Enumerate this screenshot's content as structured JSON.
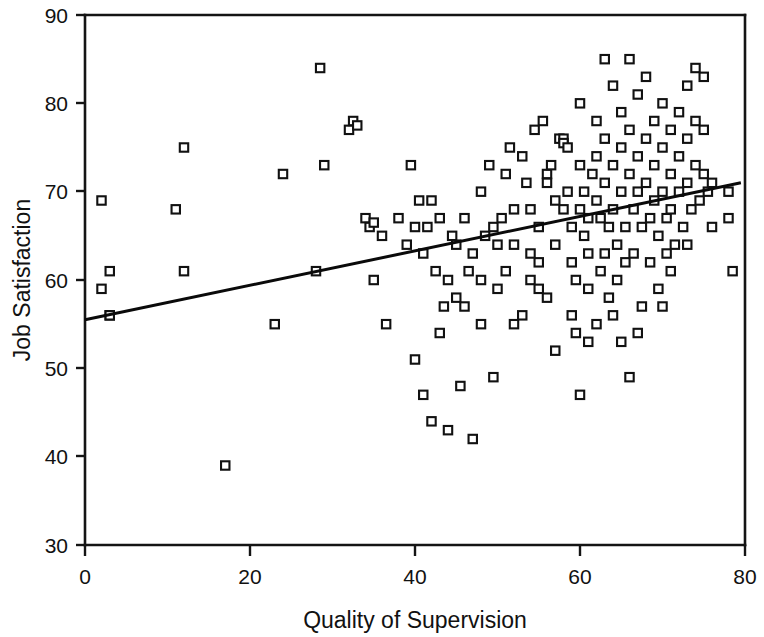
{
  "chart_data": {
    "type": "scatter",
    "title": "",
    "xlabel": "Quality of Supervision",
    "ylabel": "Job Satisfaction",
    "xlim": [
      0,
      80
    ],
    "ylim": [
      30,
      90
    ],
    "xticks": [
      0,
      20,
      40,
      60,
      80
    ],
    "yticks": [
      30,
      40,
      50,
      60,
      70,
      80,
      90
    ],
    "xtick_labels": [
      "0",
      "20",
      "40",
      "60",
      "80"
    ],
    "ytick_labels": [
      "30",
      "40",
      "50",
      "60",
      "70",
      "80",
      "90"
    ],
    "grid": false,
    "legend": null,
    "marker": "open-square",
    "marker_color": "#111111",
    "marker_fill": "#ffffff",
    "line_color": "#0a0a0a",
    "series": [
      {
        "name": "Observations",
        "points": [
          [
            2,
            69
          ],
          [
            2,
            59
          ],
          [
            3,
            56
          ],
          [
            3,
            61
          ],
          [
            3,
            56
          ],
          [
            11,
            68
          ],
          [
            12,
            75
          ],
          [
            12,
            61
          ],
          [
            17,
            39
          ],
          [
            23,
            55
          ],
          [
            24,
            72
          ],
          [
            28,
            61
          ],
          [
            28.5,
            84
          ],
          [
            29,
            73
          ],
          [
            32,
            77
          ],
          [
            32.5,
            78
          ],
          [
            33,
            77.5
          ],
          [
            34,
            67
          ],
          [
            34.5,
            66
          ],
          [
            35,
            66.5
          ],
          [
            35,
            60
          ],
          [
            36,
            65
          ],
          [
            36.5,
            55
          ],
          [
            38,
            67
          ],
          [
            39,
            64
          ],
          [
            39.5,
            73
          ],
          [
            40,
            51
          ],
          [
            40.5,
            69
          ],
          [
            41,
            63
          ],
          [
            41,
            47
          ],
          [
            41.5,
            66
          ],
          [
            42,
            69
          ],
          [
            42,
            44
          ],
          [
            42.5,
            61
          ],
          [
            43,
            54
          ],
          [
            43.5,
            57
          ],
          [
            44,
            43
          ],
          [
            44.5,
            65
          ],
          [
            45,
            64
          ],
          [
            45,
            58
          ],
          [
            45.5,
            48
          ],
          [
            46,
            67
          ],
          [
            46.5,
            61
          ],
          [
            47,
            42
          ],
          [
            48,
            70
          ],
          [
            48,
            55
          ],
          [
            48.5,
            65
          ],
          [
            49,
            73
          ],
          [
            49.5,
            66
          ],
          [
            49.5,
            49
          ],
          [
            50,
            64
          ],
          [
            50.5,
            67
          ],
          [
            51,
            72
          ],
          [
            51.5,
            75
          ],
          [
            52,
            64
          ],
          [
            52,
            55
          ],
          [
            53,
            74
          ],
          [
            53.5,
            71
          ],
          [
            54,
            68
          ],
          [
            54,
            60
          ],
          [
            54.5,
            77
          ],
          [
            55,
            66
          ],
          [
            55,
            62
          ],
          [
            55.5,
            78
          ],
          [
            56,
            72
          ],
          [
            56,
            58
          ],
          [
            56.5,
            73
          ],
          [
            57,
            69
          ],
          [
            57,
            64
          ],
          [
            57.5,
            76
          ],
          [
            58,
            76
          ],
          [
            58,
            75.5
          ],
          [
            58.5,
            75
          ],
          [
            58.5,
            70
          ],
          [
            59,
            66
          ],
          [
            59,
            62
          ],
          [
            59.5,
            54
          ],
          [
            59.5,
            60
          ],
          [
            60,
            80
          ],
          [
            60,
            73
          ],
          [
            60,
            68
          ],
          [
            60.5,
            70
          ],
          [
            60.5,
            65
          ],
          [
            61,
            59
          ],
          [
            61,
            53
          ],
          [
            61,
            63
          ],
          [
            61.5,
            72
          ],
          [
            62,
            78
          ],
          [
            62,
            74
          ],
          [
            62,
            69
          ],
          [
            62.5,
            67
          ],
          [
            62.5,
            61
          ],
          [
            63,
            85
          ],
          [
            63,
            76
          ],
          [
            63,
            71
          ],
          [
            63.5,
            66
          ],
          [
            63.5,
            58
          ],
          [
            64,
            82
          ],
          [
            64,
            73
          ],
          [
            64,
            68
          ],
          [
            64.5,
            64
          ],
          [
            64.5,
            60
          ],
          [
            65,
            79
          ],
          [
            65,
            75
          ],
          [
            65,
            70
          ],
          [
            65.5,
            66
          ],
          [
            65.5,
            62
          ],
          [
            66,
            85
          ],
          [
            66,
            77
          ],
          [
            66,
            72
          ],
          [
            66.5,
            68
          ],
          [
            66.5,
            63
          ],
          [
            67,
            81
          ],
          [
            67,
            74
          ],
          [
            67,
            70
          ],
          [
            67.5,
            66
          ],
          [
            67.5,
            57
          ],
          [
            68,
            83
          ],
          [
            68,
            76
          ],
          [
            68,
            71
          ],
          [
            68.5,
            67
          ],
          [
            68.5,
            62
          ],
          [
            69,
            78
          ],
          [
            69,
            73
          ],
          [
            69,
            69
          ],
          [
            69.5,
            65
          ],
          [
            69.5,
            59
          ],
          [
            70,
            80
          ],
          [
            70,
            75
          ],
          [
            70,
            70
          ],
          [
            70.5,
            67
          ],
          [
            70.5,
            63
          ],
          [
            71,
            77
          ],
          [
            71,
            72
          ],
          [
            71,
            68
          ],
          [
            71.5,
            64
          ],
          [
            72,
            79
          ],
          [
            72,
            74
          ],
          [
            72,
            70
          ],
          [
            72.5,
            66
          ],
          [
            73,
            82
          ],
          [
            73,
            76
          ],
          [
            73,
            71
          ],
          [
            73.5,
            68
          ],
          [
            74,
            84
          ],
          [
            74,
            78
          ],
          [
            74,
            73
          ],
          [
            74.5,
            69
          ],
          [
            75,
            83
          ],
          [
            75,
            77
          ],
          [
            75,
            72
          ],
          [
            75.5,
            70
          ],
          [
            76,
            71
          ],
          [
            78,
            70
          ],
          [
            78,
            67
          ],
          [
            78.5,
            61
          ],
          [
            66,
            49
          ],
          [
            60,
            47
          ],
          [
            57,
            52
          ],
          [
            53,
            56
          ],
          [
            50,
            59
          ],
          [
            47,
            63
          ],
          [
            44,
            60
          ],
          [
            52,
            68
          ],
          [
            56,
            71
          ],
          [
            64,
            56
          ],
          [
            67,
            54
          ],
          [
            70,
            57
          ],
          [
            59,
            56
          ],
          [
            62,
            55
          ],
          [
            65,
            53
          ],
          [
            55,
            59
          ],
          [
            58,
            68
          ],
          [
            61,
            67
          ],
          [
            63,
            63
          ],
          [
            71,
            61
          ],
          [
            73,
            64
          ],
          [
            76,
            66
          ],
          [
            51,
            61
          ],
          [
            54,
            63
          ],
          [
            48,
            60
          ],
          [
            46,
            57
          ],
          [
            43,
            67
          ],
          [
            40,
            66
          ]
        ]
      }
    ],
    "fit_line": {
      "name": "regression-line",
      "x_start": 0,
      "y_start": 55.5,
      "x_end": 79.5,
      "y_end": 71.0
    }
  },
  "axes": {
    "x_label": "Quality of Supervision",
    "y_label": "Job Satisfaction"
  }
}
